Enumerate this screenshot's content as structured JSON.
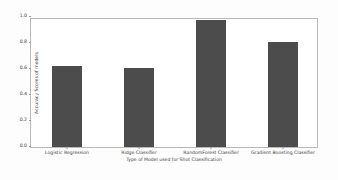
{
  "chart_data": {
    "type": "bar",
    "title": "",
    "xlabel": "Type of Model used for Shot Classification",
    "ylabel": "Accuracy Scores of models",
    "categories": [
      "Logistic Regression",
      "Ridge Classifier",
      "RandomForest Classifier",
      "Gradient Boosting Classifier"
    ],
    "values": [
      0.625,
      0.605,
      0.975,
      0.81
    ],
    "ylim": [
      0.0,
      1.0
    ],
    "yticks": [
      "0.0",
      "0.2",
      "0.4",
      "0.6",
      "0.8",
      "1.0"
    ],
    "ytick_values": [
      0.0,
      0.2,
      0.4,
      0.6,
      0.8,
      1.0
    ],
    "grid": false,
    "legend": null,
    "bar_color": "#4c4c4c",
    "background_color": "#ffffff",
    "axis_color": "#b9b9b9",
    "text_color": "#3c3c3c"
  }
}
